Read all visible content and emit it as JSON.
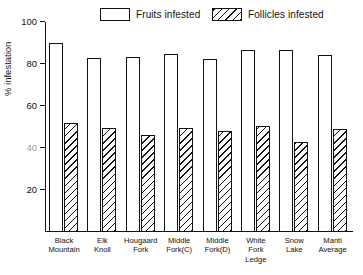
{
  "chart_data": {
    "type": "bar",
    "title": "",
    "xlabel": "",
    "ylabel": "% infestation",
    "ylim": [
      0,
      100
    ],
    "yticks": [
      20,
      40,
      60,
      80,
      100
    ],
    "ytick_labels": [
      "20",
      "40",
      "60",
      "80",
      "100"
    ],
    "grid": false,
    "legend_position": "top",
    "categories": [
      "Black\nMountain",
      "Elk\nKnoll",
      "Hougaard\nFork",
      "Middle\nFork(C)",
      "Middle\nFork(D)",
      "White\nFork\nLedge",
      "Snow\nLake",
      "Manti\nAverage"
    ],
    "series": [
      {
        "name": "Fruits infested",
        "pattern": "open",
        "values": [
          90,
          83,
          83.5,
          85,
          82.5,
          86.5,
          86.5,
          84.5
        ]
      },
      {
        "name": "Follicles infested",
        "pattern": "diagonal-hatch",
        "values": [
          52,
          49.5,
          46,
          49.5,
          48,
          50.5,
          43,
          49
        ]
      }
    ]
  },
  "legend": {
    "entries": [
      {
        "label": "Fruits infested",
        "swatch": "open-box-swatch"
      },
      {
        "label": "Follicles infested",
        "swatch": "hatched-box-swatch"
      }
    ]
  }
}
